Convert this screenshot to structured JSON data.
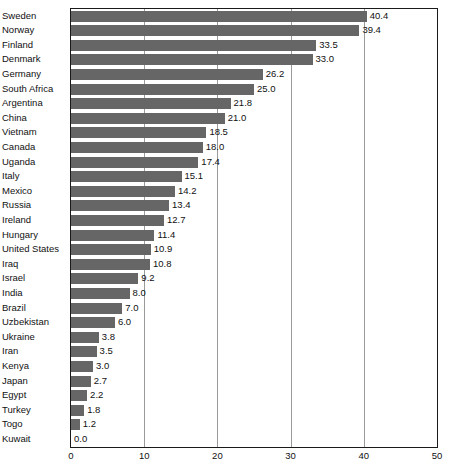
{
  "chart_data": {
    "type": "bar",
    "orientation": "horizontal",
    "title": "",
    "subtitle": "",
    "xlabel": "",
    "ylabel": "",
    "xlim": [
      0,
      50
    ],
    "xticks": [
      0,
      10,
      20,
      30,
      40,
      50
    ],
    "grid": true,
    "grid_axis": "x",
    "legend": null,
    "bar_color": "#666666",
    "axis_color": "#1a1a1a",
    "grid_color": "#9a9a9a",
    "categories": [
      "Sweden",
      "Norway",
      "Finland",
      "Denmark",
      "Germany",
      "South Africa",
      "Argentina",
      "China",
      "Vietnam",
      "Canada",
      "Uganda",
      "Italy",
      "Mexico",
      "Russia",
      "Ireland",
      "Hungary",
      "United States",
      "Iraq",
      "Israel",
      "India",
      "Brazil",
      "Uzbekistan",
      "Ukraine",
      "Iran",
      "Kenya",
      "Japan",
      "Egypt",
      "Turkey",
      "Togo",
      "Kuwait"
    ],
    "values": [
      40.4,
      39.4,
      33.5,
      33.0,
      26.2,
      25.0,
      21.8,
      21.0,
      18.5,
      18.0,
      17.4,
      15.1,
      14.2,
      13.4,
      12.7,
      11.4,
      10.9,
      10.8,
      9.2,
      8.0,
      7.0,
      6.0,
      3.8,
      3.5,
      3.0,
      2.7,
      2.2,
      1.8,
      1.2,
      0.0
    ],
    "value_labels": [
      "40.4",
      "39.4",
      "33.5",
      "33.0",
      "26.2",
      "25.0",
      "21.8",
      "21.0",
      "18.5",
      "18.0",
      "17.4",
      "15.1",
      "14.2",
      "13.4",
      "12.7",
      "11.4",
      "10.9",
      "10.8",
      "9.2",
      "8.0",
      "7.0",
      "6.0",
      "3.8",
      "3.5",
      "3.0",
      "2.7",
      "2.2",
      "1.8",
      "1.2",
      "0.0"
    ],
    "xtick_labels": [
      "0",
      "10",
      "20",
      "30",
      "40",
      "50"
    ]
  }
}
